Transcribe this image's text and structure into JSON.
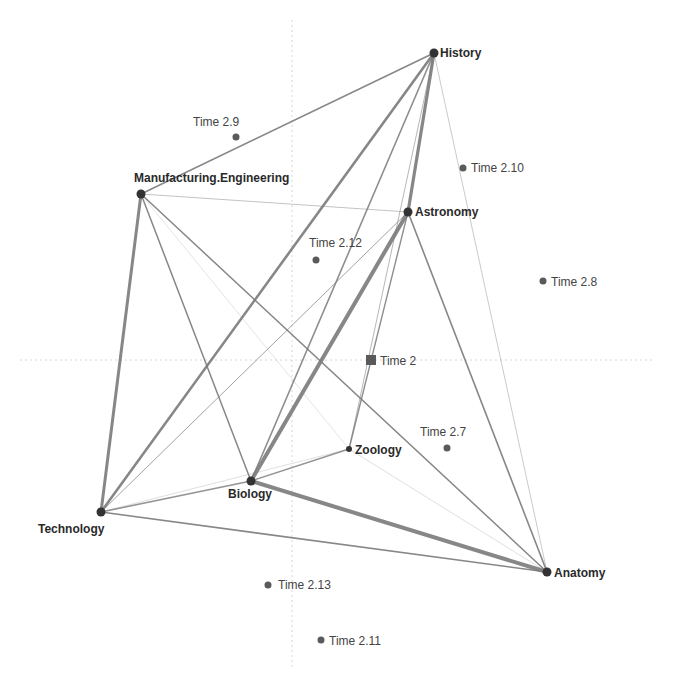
{
  "diagram": {
    "type": "network-biplot",
    "colors": {
      "edge": "#7a7a7a",
      "node": "#333333",
      "time_point": "#5a5a5a",
      "grid": "#d6d6d6"
    },
    "grid": {
      "vertical_x": 292,
      "horizontal_y": 360
    },
    "nodes": [
      {
        "id": "History",
        "label": "History",
        "x": 434,
        "y": 53,
        "lx": 440,
        "ly": 57,
        "anchor": "start"
      },
      {
        "id": "ME",
        "label": "Manufacturing.Engineering",
        "x": 141,
        "y": 194,
        "lx": 134,
        "ly": 182,
        "anchor": "start"
      },
      {
        "id": "Astronomy",
        "label": "Astronomy",
        "x": 408,
        "y": 212,
        "lx": 415,
        "ly": 216,
        "anchor": "start"
      },
      {
        "id": "Zoology",
        "label": "Zoology",
        "x": 349,
        "y": 449,
        "lx": 355,
        "ly": 454,
        "anchor": "start"
      },
      {
        "id": "Biology",
        "label": "Biology",
        "x": 251,
        "y": 481,
        "lx": 228,
        "ly": 498,
        "anchor": "start"
      },
      {
        "id": "Technology",
        "label": "Technology",
        "x": 101,
        "y": 512,
        "lx": 38,
        "ly": 533,
        "anchor": "start"
      },
      {
        "id": "Anatomy",
        "label": "Anatomy",
        "x": 547,
        "y": 572,
        "lx": 554,
        "ly": 577,
        "anchor": "start"
      }
    ],
    "edges": [
      {
        "a": "ME",
        "b": "History",
        "w": 1.6,
        "o": 0.9
      },
      {
        "a": "ME",
        "b": "Technology",
        "w": 3,
        "o": 0.9
      },
      {
        "a": "ME",
        "b": "Biology",
        "w": 1.5,
        "o": 0.9
      },
      {
        "a": "ME",
        "b": "Anatomy",
        "w": 1.5,
        "o": 0.9
      },
      {
        "a": "ME",
        "b": "Astronomy",
        "w": 1,
        "o": 0.45
      },
      {
        "a": "ME",
        "b": "Zoology",
        "w": 0.8,
        "o": 0.25
      },
      {
        "a": "History",
        "b": "Technology",
        "w": 2.6,
        "o": 0.9
      },
      {
        "a": "History",
        "b": "Biology",
        "w": 1.6,
        "o": 0.85
      },
      {
        "a": "History",
        "b": "Astronomy",
        "w": 3.2,
        "o": 0.9
      },
      {
        "a": "History",
        "b": "Zoology",
        "w": 1,
        "o": 0.55
      },
      {
        "a": "History",
        "b": "Anatomy",
        "w": 1,
        "o": 0.4
      },
      {
        "a": "Astronomy",
        "b": "Biology",
        "w": 4,
        "o": 0.9
      },
      {
        "a": "Astronomy",
        "b": "Technology",
        "w": 1,
        "o": 0.7
      },
      {
        "a": "Astronomy",
        "b": "Anatomy",
        "w": 1.6,
        "o": 0.9
      },
      {
        "a": "Astronomy",
        "b": "Zoology",
        "w": 1.4,
        "o": 0.85
      },
      {
        "a": "Biology",
        "b": "Anatomy",
        "w": 4,
        "o": 0.9
      },
      {
        "a": "Biology",
        "b": "Zoology",
        "w": 1.4,
        "o": 0.8
      },
      {
        "a": "Technology",
        "b": "Anatomy",
        "w": 1.6,
        "o": 0.9
      },
      {
        "a": "Technology",
        "b": "Biology",
        "w": 1.6,
        "o": 0.8
      },
      {
        "a": "Technology",
        "b": "Zoology",
        "w": 0.8,
        "o": 0.3
      },
      {
        "a": "Zoology",
        "b": "Anatomy",
        "w": 0.8,
        "o": 0.3
      }
    ],
    "time_points": [
      {
        "label": "Time 2.9",
        "x": 236,
        "y": 137,
        "lx": 193,
        "ly": 126,
        "anchor": "start"
      },
      {
        "label": "Time 2.10",
        "x": 463,
        "y": 168,
        "lx": 471,
        "ly": 172,
        "anchor": "start"
      },
      {
        "label": "Time 2.12",
        "x": 316,
        "y": 260,
        "lx": 309,
        "ly": 247,
        "anchor": "start"
      },
      {
        "label": "Time 2.8",
        "x": 543,
        "y": 281,
        "lx": 551,
        "ly": 286,
        "anchor": "start"
      },
      {
        "label": "Time 2",
        "x": 371,
        "y": 360,
        "lx": 380,
        "ly": 365,
        "anchor": "start",
        "shape": "square"
      },
      {
        "label": "Time 2.7",
        "x": 447,
        "y": 448,
        "lx": 420,
        "ly": 436,
        "anchor": "start"
      },
      {
        "label": "Time 2.13",
        "x": 268,
        "y": 585,
        "lx": 278,
        "ly": 589,
        "anchor": "start"
      },
      {
        "label": "Time 2.11",
        "x": 321,
        "y": 640,
        "lx": 329,
        "ly": 645,
        "anchor": "start"
      }
    ]
  }
}
